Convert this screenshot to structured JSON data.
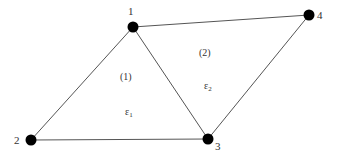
{
  "diagram": {
    "type": "finite-element-mesh",
    "colors": {
      "edge": "#555555",
      "node": "#000000",
      "text": "#333333",
      "background": "#ffffff"
    },
    "nodes": [
      {
        "id": "1",
        "label": "1",
        "x": 133,
        "y": 27
      },
      {
        "id": "2",
        "label": "2",
        "x": 31,
        "y": 140
      },
      {
        "id": "3",
        "label": "3",
        "x": 208,
        "y": 139
      },
      {
        "id": "4",
        "label": "4",
        "x": 309,
        "y": 15
      }
    ],
    "edges": [
      {
        "from": "1",
        "to": "2"
      },
      {
        "from": "2",
        "to": "3"
      },
      {
        "from": "1",
        "to": "3"
      },
      {
        "from": "1",
        "to": "4"
      },
      {
        "from": "4",
        "to": "3"
      }
    ],
    "elements": [
      {
        "id": "1",
        "label": "(1)",
        "nodes": [
          "1",
          "2",
          "3"
        ],
        "strain_symbol": "ε",
        "strain_subscript": "1"
      },
      {
        "id": "2",
        "label": "(2)",
        "nodes": [
          "1",
          "3",
          "4"
        ],
        "strain_symbol": "ε",
        "strain_subscript": "2"
      }
    ]
  }
}
